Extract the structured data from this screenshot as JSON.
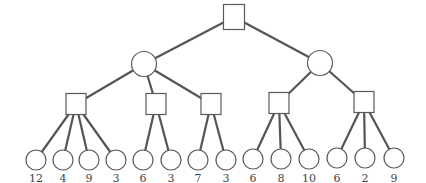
{
  "diagram": {
    "type": "game-tree",
    "root": {
      "id": "root",
      "shape": "square",
      "x": 234,
      "y": 17
    },
    "level1": [
      {
        "id": "c1",
        "shape": "circle",
        "x": 144,
        "y": 64,
        "parent": "root"
      },
      {
        "id": "c2",
        "shape": "circle",
        "x": 320,
        "y": 63,
        "parent": "root"
      }
    ],
    "level2": [
      {
        "id": "s1",
        "shape": "square",
        "x": 76,
        "y": 104,
        "parent": "c1"
      },
      {
        "id": "s2",
        "shape": "square",
        "x": 156,
        "y": 104,
        "parent": "c1"
      },
      {
        "id": "s3",
        "shape": "square",
        "x": 211,
        "y": 104,
        "parent": "c1"
      },
      {
        "id": "s4",
        "shape": "square",
        "x": 279,
        "y": 103,
        "parent": "c2"
      },
      {
        "id": "s5",
        "shape": "square",
        "x": 364,
        "y": 102,
        "parent": "c2"
      }
    ],
    "leaves": [
      {
        "id": "l1",
        "x": 36,
        "y": 160,
        "parent": "s1",
        "value": "12"
      },
      {
        "id": "l2",
        "x": 63,
        "y": 160,
        "parent": "s1",
        "value": "4"
      },
      {
        "id": "l3",
        "x": 89,
        "y": 160,
        "parent": "s1",
        "value": "9"
      },
      {
        "id": "l4",
        "x": 116,
        "y": 160,
        "parent": "s1",
        "value": "3"
      },
      {
        "id": "l5",
        "x": 143,
        "y": 160,
        "parent": "s2",
        "value": "6"
      },
      {
        "id": "l6",
        "x": 171,
        "y": 160,
        "parent": "s2",
        "value": "3"
      },
      {
        "id": "l7",
        "x": 198,
        "y": 160,
        "parent": "s3",
        "value": "7"
      },
      {
        "id": "l8",
        "x": 226,
        "y": 160,
        "parent": "s3",
        "value": "3"
      },
      {
        "id": "l9",
        "x": 253,
        "y": 159,
        "parent": "s4",
        "value": "6"
      },
      {
        "id": "l10",
        "x": 281,
        "y": 159,
        "parent": "s4",
        "value": "8"
      },
      {
        "id": "l11",
        "x": 309,
        "y": 159,
        "parent": "s4",
        "value": "10"
      },
      {
        "id": "l12",
        "x": 337,
        "y": 158,
        "parent": "s5",
        "value": "6"
      },
      {
        "id": "l13",
        "x": 365,
        "y": 158,
        "parent": "s5",
        "value": "2"
      },
      {
        "id": "l14",
        "x": 394,
        "y": 158,
        "parent": "s5",
        "value": "9"
      }
    ],
    "leaf_values": [
      "12",
      "4",
      "9",
      "3",
      "6",
      "3",
      "7",
      "3",
      "6",
      "8",
      "10",
      "6",
      "2",
      "9"
    ],
    "colors": {
      "edge": "#555555",
      "node_stroke": "#5a5a5a",
      "node_fill": "#ffffff",
      "label": "#444444"
    }
  }
}
